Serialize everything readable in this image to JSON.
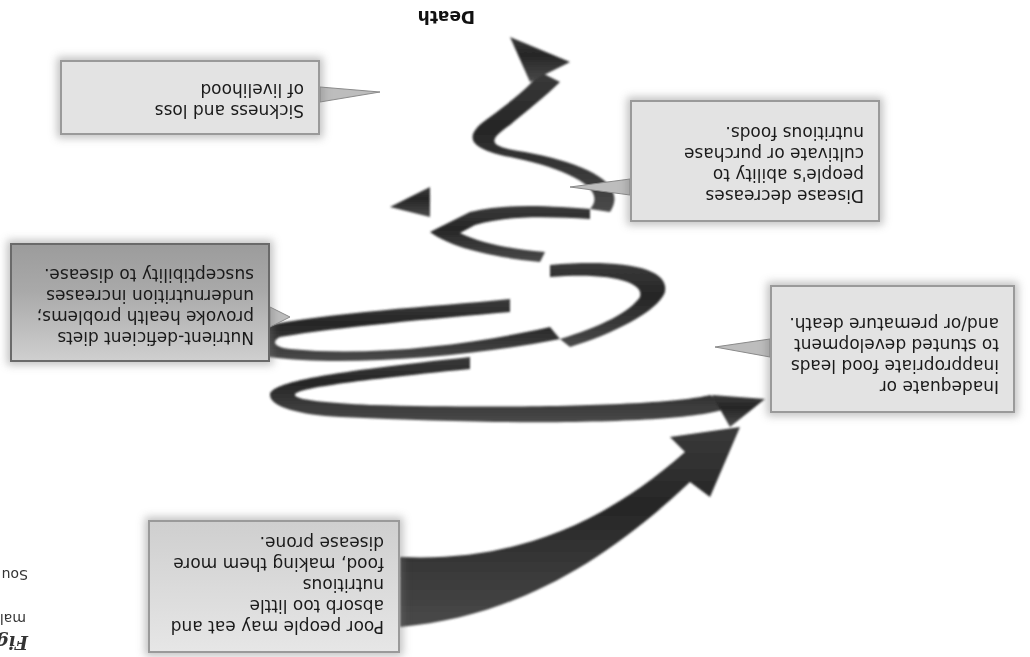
{
  "diagram": {
    "top_label": "Death",
    "orientation": "rotated 180 degrees",
    "callouts": [
      {
        "id": "poor-people",
        "lines": [
          "Poor people may eat and",
          "absorb too little nutritious",
          "food, making them more",
          "disease prone."
        ]
      },
      {
        "id": "inadequate-food",
        "lines": [
          "Inadequate or",
          "inappropriate food leads",
          "to stunted development",
          "and/or premature death."
        ]
      },
      {
        "id": "nutrient-deficient",
        "lines": [
          "Nutrient-deficient diets",
          "provoke health problems;",
          "undernutrition increases",
          "susceptibility to disease."
        ]
      },
      {
        "id": "disease-decreases",
        "lines": [
          "Disease decreases",
          "people's ability to",
          "cultivate or purchase",
          "nutritious foods."
        ]
      },
      {
        "id": "sickness",
        "lines": [
          "Sickness and loss",
          "of livelihood"
        ]
      }
    ],
    "side_fragments": {
      "fig": "Fig",
      "mal": "mal",
      "source": "Sou"
    },
    "colors": {
      "arrow": "#2e2e2e",
      "box_light": "#e3e3e3",
      "box_dark": "#a9a9a9",
      "border": "#9a9a9a"
    }
  }
}
